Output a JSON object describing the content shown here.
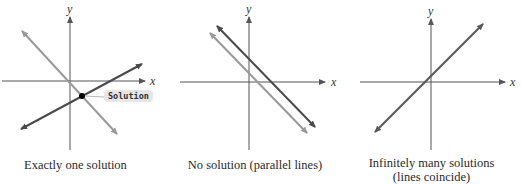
{
  "figure": {
    "panels": [
      {
        "id": "one-solution",
        "caption": "Exactly one solution",
        "x_label": "x",
        "y_label": "y",
        "annotation": "Solution",
        "lines": [
          {
            "name": "line-1",
            "slope": "negative",
            "color": "#8f8f8f"
          },
          {
            "name": "line-2",
            "slope": "positive",
            "color": "#555555"
          }
        ],
        "intersection": "single point"
      },
      {
        "id": "no-solution",
        "caption": "No solution (parallel lines)",
        "x_label": "x",
        "y_label": "y",
        "lines": [
          {
            "name": "line-1",
            "slope": "negative",
            "color": "#555555"
          },
          {
            "name": "line-2",
            "slope": "negative",
            "color": "#9a9a9a"
          }
        ],
        "intersection": "none"
      },
      {
        "id": "infinite-solutions",
        "caption_line1": "Infinitely many solutions",
        "caption_line2": "(lines coincide)",
        "x_label": "x",
        "y_label": "y",
        "lines": [
          {
            "name": "coincident-line",
            "slope": "positive",
            "color": "#666666"
          }
        ],
        "intersection": "all points"
      }
    ],
    "colors": {
      "axis": "#555555",
      "dark_line": "#555555",
      "light_line": "#9a9a9a",
      "label_bg": "#e6e6e6"
    }
  }
}
